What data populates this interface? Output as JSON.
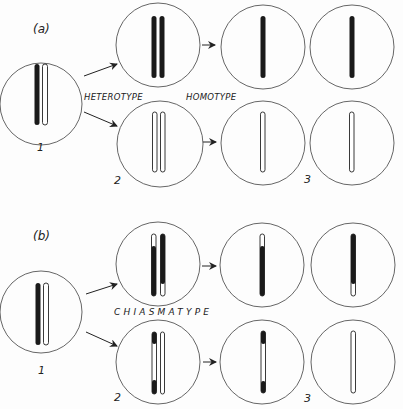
{
  "panels": [
    {
      "id": "a",
      "label": "(a)",
      "type_labels": {
        "left": "HETEROTYPE",
        "right": "HOMOTYPE"
      },
      "stage_numbers": {
        "first": "1",
        "second": "2",
        "third": "3"
      },
      "chromosomes": {
        "stage1": "one dark + one light homolog paired",
        "top_stage2": "two dark sister chromatids",
        "bottom_stage2": "two light sister chromatids",
        "top_stage3": [
          "dark",
          "dark"
        ],
        "bottom_stage3": [
          "light",
          "light"
        ]
      }
    },
    {
      "id": "b",
      "label": "(b)",
      "type_labels": {
        "center": "CHIASMATYPE"
      },
      "stage_numbers": {
        "first": "1",
        "second": "2",
        "third": "3"
      },
      "chromosomes": {
        "stage1": "one dark + one light homolog paired",
        "top_stage2": "recombinant (light tip, dark body) + dark (light end)",
        "bottom_stage2": "recombinant (dark ends, light middle) + light",
        "top_stage3": [
          "light tip / dark body",
          "dark body / light end"
        ],
        "bottom_stage3": [
          "dark ends / light middle",
          "light"
        ]
      }
    }
  ],
  "colors": {
    "stroke": "#222222",
    "cell_outline": "#555555",
    "chromatin_dark": "#1a1a1a",
    "chromatin_light": "#ffffff"
  }
}
